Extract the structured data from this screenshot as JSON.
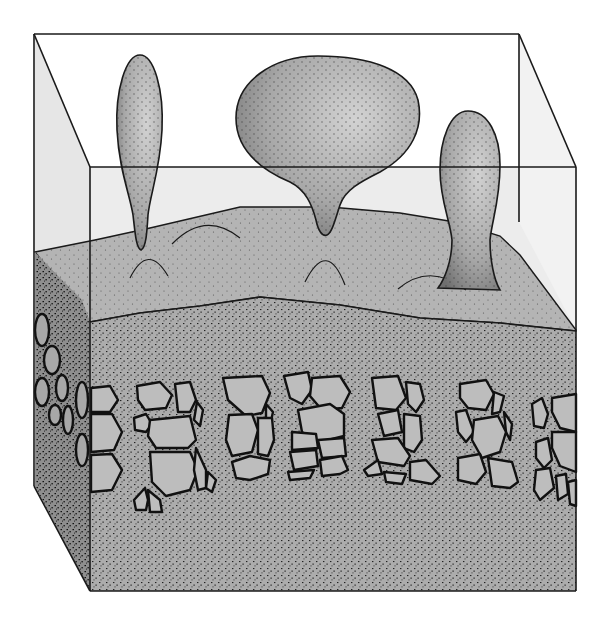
{
  "figure": {
    "type": "block-diagram",
    "labels": []
  },
  "colors": {
    "background": "#ffffff",
    "outline": "#1a1a1a",
    "glass_face": "#e9e9e9",
    "salt_layer": "#b4b4b4",
    "diapir": "#a9a9a9",
    "sediment": "#a8a8a8",
    "side_face": "#8a8a8a",
    "clast_fill": "#bdbdbd",
    "stipple": "#222222"
  },
  "layers": [
    {
      "name": "transparent-overburden",
      "position": "top"
    },
    {
      "name": "salt-source-layer",
      "position": "middle"
    },
    {
      "name": "conglomerate-band",
      "position": "lower-middle"
    },
    {
      "name": "basal-sediment",
      "position": "bottom"
    }
  ],
  "diapirs": [
    {
      "name": "left-diapir",
      "shape": "teardrop"
    },
    {
      "name": "center-diapir",
      "shape": "mushroom-bulb"
    },
    {
      "name": "right-diapir",
      "shape": "stalked-dome"
    }
  ]
}
